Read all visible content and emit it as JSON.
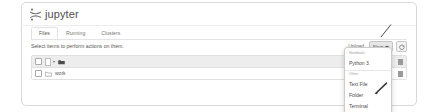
{
  "app": {
    "logo_text": "jupyter",
    "logo_icon": "jupyter-logo-icon"
  },
  "tabs": [
    {
      "label": "Files",
      "name": "tab-files",
      "active": true
    },
    {
      "label": "Running",
      "name": "tab-running",
      "active": false
    },
    {
      "label": "Clusters",
      "name": "tab-clusters",
      "active": false
    }
  ],
  "actions": {
    "select_note": "Select items to perform actions on them.",
    "upload_label": "Upload",
    "new_label": "New",
    "new_caret_icon": "chevron-down-icon",
    "refresh_icon": "refresh-icon"
  },
  "filelist": {
    "toolbar": {
      "select_all_checkbox_icon": "checkbox-icon",
      "select_scope_caret_icon": "chevron-down-icon",
      "home_folder_icon": "folder-icon"
    },
    "rows": [
      {
        "checkbox_icon": "checkbox-icon",
        "type_icon": "folder-icon",
        "name": "work"
      }
    ]
  },
  "new_menu": {
    "sections": [
      {
        "header": "Notebook:",
        "items": [
          "Python 3"
        ]
      },
      {
        "header": "Other:",
        "items": [
          "Text File",
          "Folder",
          "Terminal"
        ]
      }
    ]
  },
  "annotations": {
    "pointer_line_name": "annotation-line-to-new-button",
    "cursor_name": "mouse-cursor-arrow"
  },
  "colors": {
    "card_border": "#d9d9d9",
    "toolbar_bg": "#ededed",
    "text": "#4e4e4e",
    "muted": "#9d9d9d"
  }
}
